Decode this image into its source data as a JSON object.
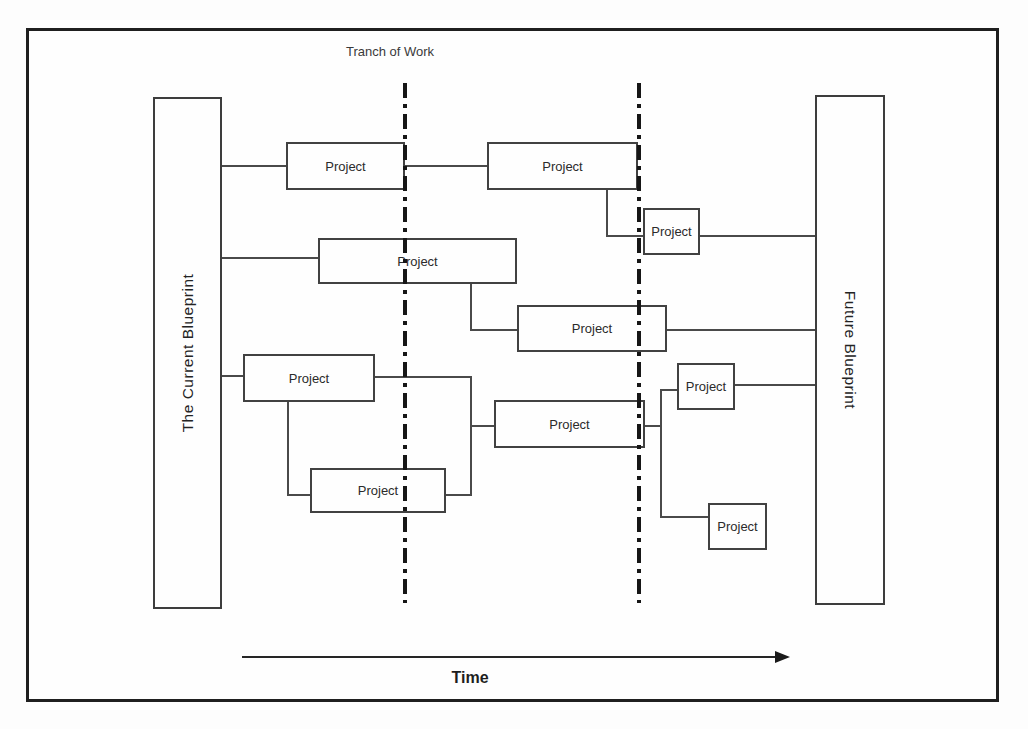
{
  "diagram": {
    "title": "Tranch of Work",
    "left_blueprint": "The Current Blueprint",
    "right_blueprint": "Future Blueprint",
    "time_axis": "Time",
    "projects": [
      {
        "id": "p1",
        "label": "Project"
      },
      {
        "id": "p2",
        "label": "Project"
      },
      {
        "id": "p3",
        "label": "Project"
      },
      {
        "id": "p4",
        "label": "Project"
      },
      {
        "id": "p5",
        "label": "Project"
      },
      {
        "id": "p6",
        "label": "Project"
      },
      {
        "id": "p7",
        "label": "Project"
      },
      {
        "id": "p8",
        "label": "Project"
      },
      {
        "id": "p9",
        "label": "Project"
      },
      {
        "id": "p10",
        "label": "Project"
      }
    ],
    "tranche_divider_count": 2
  }
}
